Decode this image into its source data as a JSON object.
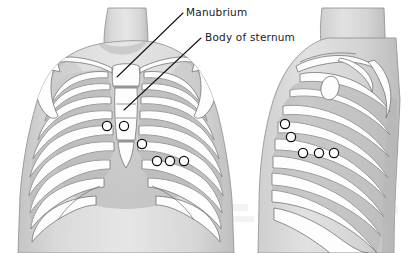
{
  "figure": {
    "background_color": "#ffffff",
    "ink_color": "#111111",
    "skin_fill": "#d9d9d9",
    "skin_shadow": "#bfbfbf",
    "bone_fill": "#fdfdfd",
    "bone_stroke": "#6f6f6f",
    "intercostal_fill": "#c9c9c9",
    "marker_fill": "#ffffff",
    "marker_stroke": "#101010"
  },
  "labels": [
    {
      "id": "manubrium",
      "text": "Manubrium",
      "text_x": 186,
      "text_y": 16,
      "leader": {
        "x1": 183,
        "y1": 13,
        "x2": 117,
        "y2": 77
      }
    },
    {
      "id": "body-of-sternum",
      "text": "Body of sternum",
      "text_x": 205,
      "text_y": 41,
      "leader": {
        "x1": 201,
        "y1": 38,
        "x2": 124,
        "y2": 110
      }
    }
  ],
  "views": [
    {
      "id": "anterior-view",
      "name": "anterior-thorax-view",
      "markers": [
        {
          "id": "a1",
          "cx": 107,
          "cy": 126,
          "r": 4.6
        },
        {
          "id": "a2",
          "cx": 124,
          "cy": 126,
          "r": 4.6
        },
        {
          "id": "a3",
          "cx": 142,
          "cy": 144,
          "r": 4.6
        },
        {
          "id": "a4",
          "cx": 157,
          "cy": 161,
          "r": 4.6
        },
        {
          "id": "a5",
          "cx": 170,
          "cy": 161,
          "r": 4.6
        },
        {
          "id": "a6",
          "cx": 184,
          "cy": 161,
          "r": 4.6
        }
      ],
      "marker_count": 6
    },
    {
      "id": "lateral-view",
      "name": "lateral-thorax-view",
      "markers": [
        {
          "id": "l1",
          "cx": 285,
          "cy": 124,
          "r": 4.6
        },
        {
          "id": "l2",
          "cx": 291,
          "cy": 137,
          "r": 4.6
        },
        {
          "id": "l3",
          "cx": 303,
          "cy": 153,
          "r": 4.6
        },
        {
          "id": "l4",
          "cx": 319,
          "cy": 153,
          "r": 4.6
        },
        {
          "id": "l5",
          "cx": 334,
          "cy": 153,
          "r": 4.6
        }
      ],
      "marker_count": 5
    }
  ],
  "anatomy_parts": [
    "manubrium",
    "body-of-sternum",
    "xiphoid-process",
    "clavicle",
    "scapula",
    "ribs",
    "costal-cartilage",
    "humeral-head"
  ]
}
